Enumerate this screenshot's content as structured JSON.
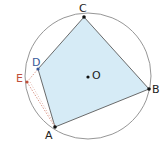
{
  "diagram": {
    "type": "geometry",
    "colors": {
      "circle": "#808080",
      "fill": "#d6ebf6",
      "edge": "#555555",
      "point": "#111111",
      "E": "#c0503a",
      "D": "#3a5a9a",
      "dashed": "#d08070"
    },
    "circle": {
      "center_label": "O",
      "cx": 88,
      "cy": 76,
      "r": 63
    },
    "points": [
      {
        "label": "A",
        "x": 55,
        "y": 127,
        "lx": 45,
        "ly": 139
      },
      {
        "label": "B",
        "x": 149,
        "y": 89,
        "lx": 152,
        "ly": 93
      },
      {
        "label": "C",
        "x": 84,
        "y": 17,
        "lx": 79,
        "ly": 12
      },
      {
        "label": "D",
        "x": 38,
        "y": 69,
        "lx": 32,
        "ly": 66
      },
      {
        "label": "E",
        "x": 27,
        "y": 82,
        "lx": 16,
        "ly": 82
      },
      {
        "label": "O",
        "x": 88,
        "y": 77,
        "lx": 92,
        "ly": 79
      }
    ],
    "labels": {
      "A": "A",
      "B": "B",
      "C": "C",
      "D": "D",
      "E": "E",
      "O": "O"
    }
  }
}
